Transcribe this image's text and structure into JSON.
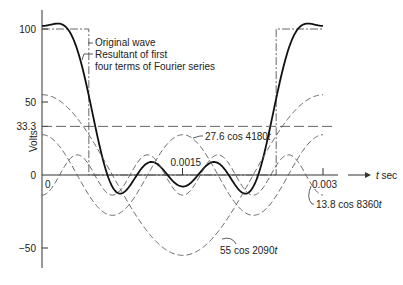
{
  "chart_data": {
    "type": "line",
    "title": "",
    "xlabel": "t sec",
    "ylabel": "Volts",
    "xlim": [
      0,
      0.003
    ],
    "ylim": [
      -60,
      110
    ],
    "x_ticks": [
      {
        "value": 0,
        "label": "0"
      },
      {
        "value": 0.0015,
        "label": "0.0015"
      },
      {
        "value": 0.003,
        "label": "0.003"
      }
    ],
    "y_ticks": [
      {
        "value": 100,
        "label": "100"
      },
      {
        "value": 50,
        "label": "50"
      },
      {
        "value": 33.3,
        "label": "33.3"
      },
      {
        "value": 0,
        "label": "0"
      },
      {
        "value": -50,
        "label": "−50"
      }
    ],
    "origin_label": "0",
    "series": [
      {
        "name": "Original wave",
        "kind": "square",
        "style": "dash-dot",
        "high": 100,
        "low": 0,
        "edges": [
          0.0005,
          0.0025
        ]
      },
      {
        "name": "Resultant of first four terms of Fourier series",
        "kind": "sum",
        "style": "solid-bold"
      },
      {
        "name": "DC component",
        "kind": "constant",
        "value": 33.3,
        "style": "long-dash"
      },
      {
        "name": "55 cos 2090t",
        "kind": "cosine",
        "amplitude": 55,
        "omega": 2090,
        "style": "dash"
      },
      {
        "name": "27.6 cos 4180t",
        "kind": "cosine",
        "amplitude": 27.6,
        "omega": 4180,
        "style": "dash"
      },
      {
        "name": "13.8 cos 8360t",
        "kind": "cosine",
        "amplitude": -13.8,
        "omega": 8360,
        "style": "dash"
      }
    ],
    "annotations": [
      {
        "text": "Original wave",
        "target": "Original wave"
      },
      {
        "text_lines": [
          "Resultant of first",
          "four terms of Fourier series"
        ],
        "target": "Resultant"
      },
      {
        "text": "27.6 cos 4180t",
        "target": "27.6 cos 4180t"
      },
      {
        "text": "55 cos 2090t",
        "target": "55 cos 2090t"
      },
      {
        "text": "13.8 cos 8360t",
        "target": "13.8 cos 8360t"
      }
    ],
    "grid": false,
    "legend": "none"
  },
  "labels": {
    "ylabel": "Volts",
    "xlabel": "t sec",
    "original_wave": "Original wave",
    "resultant_1": "Resultant of first",
    "resultant_2": "four terms of Fourier series",
    "c2": "27.6 cos 4180t",
    "c1": "55 cos 2090t",
    "c4": "13.8 cos 8360t"
  }
}
